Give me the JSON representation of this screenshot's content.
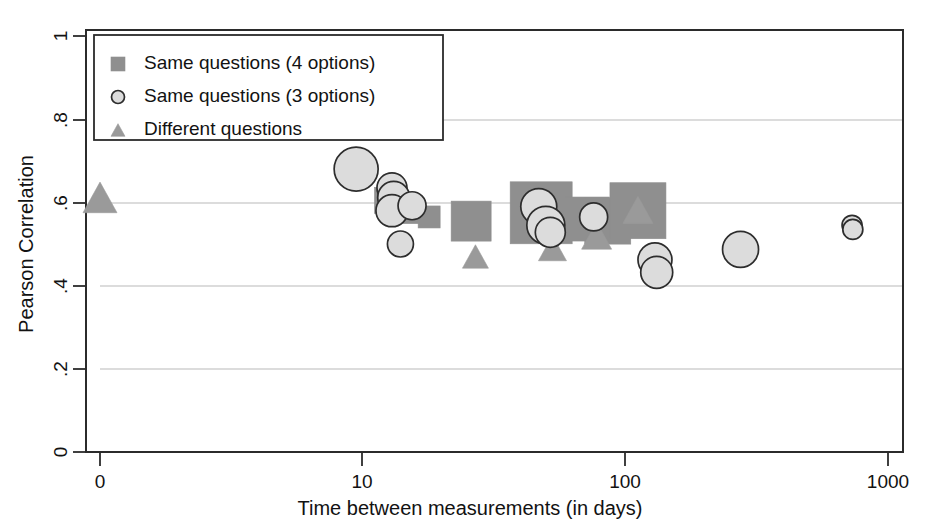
{
  "chart_data": {
    "type": "scatter",
    "title": "",
    "xlabel": "Time between measurements (in days)",
    "ylabel": "Pearson Correlation",
    "x_scale": "log-with-zero",
    "x_ticks": [
      "0",
      "10",
      "100",
      "1000"
    ],
    "x_tick_values": [
      0,
      10,
      100,
      1000
    ],
    "y_ticks": [
      "0",
      ".2",
      ".4",
      ".6",
      ".8",
      "1"
    ],
    "y_tick_values": [
      0,
      0.2,
      0.4,
      0.6,
      0.8,
      1
    ],
    "ylim": [
      0,
      1
    ],
    "grid": "horizontal",
    "legend_position": "top-left",
    "legend": [
      {
        "marker": "square",
        "label": "Same questions (4 options)",
        "color": "#8f8f8f"
      },
      {
        "marker": "circle",
        "label": "Same questions (3 options)",
        "color": "#dcdcdc"
      },
      {
        "marker": "triangle",
        "label": "Different questions",
        "color": "#9a9a9a"
      }
    ],
    "note": "Marker area encodes study sample size (bubble size).",
    "series": [
      {
        "name": "Same questions (4 options)",
        "marker": "square",
        "color": "#8f8f8f",
        "points": [
          {
            "x": 12.5,
            "y": 0.605,
            "size": 26
          },
          {
            "x": 14.5,
            "y": 0.585,
            "size": 30
          },
          {
            "x": 18.0,
            "y": 0.565,
            "size": 22
          },
          {
            "x": 26.0,
            "y": 0.555,
            "size": 40
          },
          {
            "x": 48.0,
            "y": 0.575,
            "size": 62
          },
          {
            "x": 72.0,
            "y": 0.56,
            "size": 44
          },
          {
            "x": 86.0,
            "y": 0.555,
            "size": 46
          },
          {
            "x": 112.0,
            "y": 0.58,
            "size": 56
          }
        ]
      },
      {
        "name": "Same questions (3 options)",
        "marker": "circle",
        "color": "#dcdcdc",
        "points": [
          {
            "x": 9.5,
            "y": 0.68,
            "size": 44
          },
          {
            "x": 13.0,
            "y": 0.635,
            "size": 30
          },
          {
            "x": 13.2,
            "y": 0.612,
            "size": 32
          },
          {
            "x": 13.0,
            "y": 0.58,
            "size": 32
          },
          {
            "x": 15.5,
            "y": 0.592,
            "size": 28
          },
          {
            "x": 14.0,
            "y": 0.5,
            "size": 26
          },
          {
            "x": 47.0,
            "y": 0.59,
            "size": 36
          },
          {
            "x": 50.0,
            "y": 0.545,
            "size": 38
          },
          {
            "x": 52.0,
            "y": 0.528,
            "size": 30
          },
          {
            "x": 76.0,
            "y": 0.565,
            "size": 28
          },
          {
            "x": 130.0,
            "y": 0.462,
            "size": 34
          },
          {
            "x": 132.0,
            "y": 0.432,
            "size": 32
          },
          {
            "x": 275.0,
            "y": 0.487,
            "size": 36
          },
          {
            "x": 730.0,
            "y": 0.545,
            "size": 20
          },
          {
            "x": 735.0,
            "y": 0.535,
            "size": 20
          }
        ]
      },
      {
        "name": "Different questions",
        "marker": "triangle",
        "color": "#9a9a9a",
        "points": [
          {
            "x": 0,
            "y": 0.612,
            "size": 34
          },
          {
            "x": 27.0,
            "y": 0.47,
            "size": 26
          },
          {
            "x": 52.0,
            "y": 0.552,
            "size": 30
          },
          {
            "x": 53.0,
            "y": 0.49,
            "size": 28
          },
          {
            "x": 78.0,
            "y": 0.52,
            "size": 30
          },
          {
            "x": 112.0,
            "y": 0.582,
            "size": 30
          }
        ]
      }
    ]
  },
  "axes": {
    "x_axis_name": "time-axis",
    "y_axis_name": "correlation-axis"
  }
}
